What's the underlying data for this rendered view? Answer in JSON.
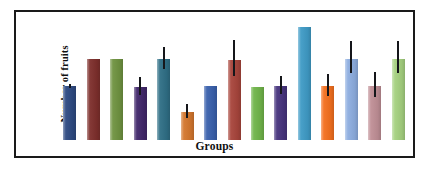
{
  "figure": {
    "border_color": "#1a1a1a",
    "background": "#ffffff"
  },
  "chart_data": {
    "type": "bar",
    "title": "",
    "subtitle": "",
    "xlabel": "Groups",
    "ylabel": "Number of fruits",
    "grid": false,
    "legend": false,
    "axis_ticks": false,
    "ylim": [
      0,
      110
    ],
    "categories": [
      "1",
      "2",
      "3",
      "4",
      "5",
      "6",
      "7",
      "8",
      "9",
      "10",
      "11",
      "12",
      "13",
      "14",
      "15"
    ],
    "values": [
      48,
      72,
      72,
      47,
      72,
      25,
      48,
      71,
      47,
      48,
      100,
      48,
      72,
      48,
      72
    ],
    "errors": [
      2,
      0,
      0,
      10,
      12,
      8,
      0,
      20,
      0,
      10,
      0,
      12,
      18,
      14,
      18
    ],
    "bar_colors": [
      "#2e4a82",
      "#7e2f2c",
      "#6f9340",
      "#41276b",
      "#2f6f86",
      "#d4772e",
      "#3a61ad",
      "#a8453c",
      "#70b54a",
      "#47347e",
      "#3f9bc6",
      "#f4701f",
      "#8eaee0",
      "#c08f96",
      "#a5d17f"
    ],
    "error_bar_color": "#15161a",
    "annotations": []
  }
}
